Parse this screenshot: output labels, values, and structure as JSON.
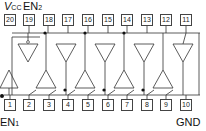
{
  "diagram": {
    "type": "ic-pinout-logic-diagram",
    "labels": {
      "vcc": "V",
      "vcc_sub": "CC",
      "en2": "EN",
      "en2_sub": "2",
      "en1": "EN",
      "en1_sub": "1",
      "gnd": "GND"
    },
    "top_pins": [
      "20",
      "19",
      "18",
      "17",
      "16",
      "15",
      "14",
      "13",
      "12",
      "11"
    ],
    "bottom_pins": [
      "1",
      "2",
      "3",
      "4",
      "5",
      "6",
      "7",
      "8",
      "9",
      "10"
    ],
    "buffers_down_count": 7,
    "buffers_up_count": 8,
    "colors": {
      "line": "#333333",
      "box": "#444444",
      "text": "#111111"
    }
  }
}
